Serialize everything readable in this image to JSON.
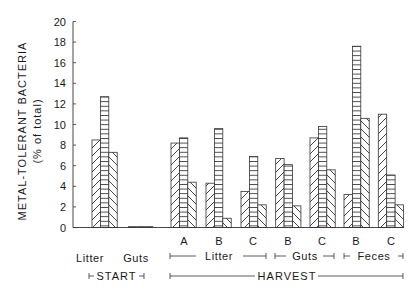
{
  "chart_data": {
    "type": "bar",
    "title": "",
    "ylabel": "METAL-TOLERANT BACTERIA",
    "ylabel_sub": "(% of total)",
    "xlabel": "",
    "ylim": [
      0,
      20
    ],
    "yticks": [
      0,
      2,
      4,
      6,
      8,
      10,
      12,
      14,
      16,
      18,
      20
    ],
    "grid": false,
    "legend": null,
    "patterns": [
      "diagonal-hatch",
      "horizontal-lines",
      "reverse-diagonal-hatch"
    ],
    "categories": [
      {
        "label": "Litter",
        "sub": "",
        "group": "START"
      },
      {
        "label": "Guts",
        "sub": "",
        "group": "START"
      },
      {
        "label": "Litter",
        "sub": "A",
        "group": "HARVEST"
      },
      {
        "label": "Litter",
        "sub": "B",
        "group": "HARVEST"
      },
      {
        "label": "Litter",
        "sub": "C",
        "group": "HARVEST"
      },
      {
        "label": "Guts",
        "sub": "B",
        "group": "HARVEST"
      },
      {
        "label": "Guts",
        "sub": "C",
        "group": "HARVEST"
      },
      {
        "label": "Feces",
        "sub": "B",
        "group": "HARVEST"
      },
      {
        "label": "Feces",
        "sub": "C",
        "group": "HARVEST"
      }
    ],
    "series": [
      {
        "name": "bar-1 (diagonal hatch)",
        "values": [
          8.5,
          0.1,
          8.2,
          4.3,
          3.5,
          6.7,
          8.7,
          3.2,
          11.0
        ]
      },
      {
        "name": "bar-2 (horizontal lines)",
        "values": [
          12.7,
          0.1,
          8.7,
          9.6,
          6.9,
          6.1,
          9.8,
          17.6,
          5.1
        ]
      },
      {
        "name": "bar-3 (reverse diagonal hatch)",
        "values": [
          7.3,
          0.1,
          4.4,
          0.9,
          2.2,
          2.1,
          5.6,
          10.6,
          2.2
        ]
      }
    ]
  },
  "axis": {
    "ylabel": "METAL-TOLERANT BACTERIA",
    "ylabel_sub": "(% of total)",
    "tick_labels": [
      "0",
      "2",
      "4",
      "6",
      "8",
      "10",
      "12",
      "14",
      "16",
      "18",
      "20"
    ]
  },
  "xaxis": {
    "sub_labels": [
      "A",
      "B",
      "C",
      "B",
      "C",
      "B",
      "C"
    ],
    "start_labels": {
      "litter": "Litter",
      "guts": "Guts"
    },
    "harvest_groups": {
      "litter": "Litter",
      "guts": "Guts",
      "feces": "Feces"
    },
    "phase_labels": {
      "start": "START",
      "harvest": "HARVEST"
    }
  }
}
